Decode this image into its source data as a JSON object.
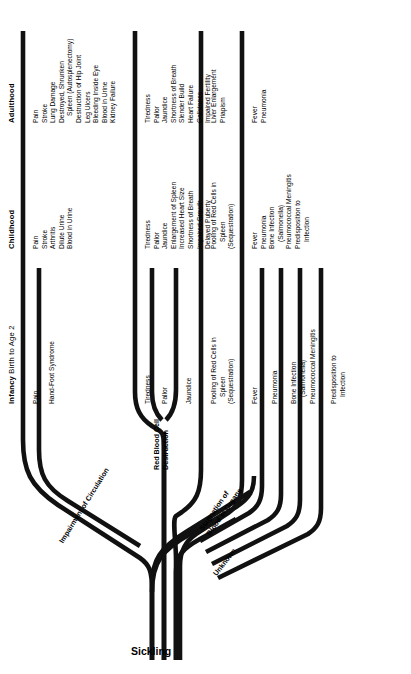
{
  "diagram": {
    "title": "Sickling",
    "root_label": "Sickling",
    "orientation": "rotated-90",
    "age_headers": [
      {
        "id": "infancy",
        "bold": "Infancy",
        "rest": " Birth to Age 2"
      },
      {
        "id": "childhood",
        "bold": "Childhood",
        "rest": ""
      },
      {
        "id": "adulthood",
        "bold": "Adulthood",
        "rest": ""
      }
    ],
    "pathways": [
      {
        "id": "impairment",
        "label": "Impairment of Circulation"
      },
      {
        "id": "rbc",
        "label": "Red Blood Cell\nDestruction",
        "line1": "Red Blood Cell",
        "line2": "Destruction"
      },
      {
        "id": "stagnation",
        "label": "Stagnation of\nBlood in Organs",
        "line1": "Stagnation of",
        "line2": "Blood in Organs"
      },
      {
        "id": "unknown",
        "label": "Unknown"
      }
    ],
    "branches": [
      {
        "id": "branch-pain",
        "pathway": "impairment",
        "start": "infancy",
        "infancy": [
          "Pain"
        ],
        "childhood": [
          "Pain",
          "Stroke",
          "Arthritis",
          "Dilute Urine",
          "Blood in Urine"
        ],
        "adulthood": [
          "Pain",
          "Stroke",
          "Lung Damage",
          "Destroyed, Shrunken",
          "Spleen (Autosplenectomy)",
          "Destruction of Hip Joint",
          "Leg Ulcers",
          "Bleeding Inside Eye",
          "Blood in Urine",
          "Kidney Failure"
        ]
      },
      {
        "id": "branch-hand-foot",
        "pathway": "impairment",
        "start": "infancy",
        "infancy": [
          "Hand-Foot Syndrome"
        ],
        "childhood": [],
        "adulthood": []
      },
      {
        "id": "branch-tiredness",
        "pathway": "rbc",
        "start": "infancy",
        "infancy": [
          "Tiredness"
        ],
        "childhood": [
          "Tiredness",
          "Pallor",
          "Jaundice",
          "Enlargement of Spleen",
          "Increased Heart Size",
          "Shortness of Breath",
          "Impaired Growth",
          "Delayed Puberty"
        ],
        "adulthood": [
          "Tiredness",
          "Pallor",
          "Jaundice",
          "Shortness of Breath",
          "Slender Build",
          "Heart Failure",
          "Gallstones",
          "Impaired Fertility"
        ]
      },
      {
        "id": "branch-pallor",
        "pathway": "rbc",
        "start": "infancy",
        "infancy": [
          "Pallor"
        ],
        "childhood": [],
        "adulthood": []
      },
      {
        "id": "branch-jaundice",
        "pathway": "rbc",
        "start": "infancy",
        "infancy": [
          "Jaundice"
        ],
        "childhood": [],
        "adulthood": []
      },
      {
        "id": "branch-pooling",
        "pathway": "stagnation",
        "start": "infancy",
        "infancy": [
          "Pooling of Red Cells in",
          "Spleen",
          "(Sequestration)"
        ],
        "childhood": [
          "Pooling of Red Cells in",
          "Spleen",
          "(Sequestration)"
        ],
        "adulthood": [
          "Liver Enlargement",
          "Priapism"
        ]
      },
      {
        "id": "branch-fever",
        "pathway": "unknown",
        "start": "infancy",
        "infancy": [
          "Fever"
        ],
        "childhood": [
          "Fever",
          "Pneumonia",
          "Bone Infection",
          "(Salmonella)",
          "Pneumococcal Meningitis",
          "Predisposition to",
          "Infection"
        ],
        "adulthood": [
          "Fever",
          "Pneumonia"
        ]
      },
      {
        "id": "branch-pneumonia",
        "pathway": "unknown",
        "start": "infancy",
        "infancy": [
          "Pneumonia"
        ],
        "childhood": [],
        "adulthood": []
      },
      {
        "id": "branch-bone-infection",
        "pathway": "unknown",
        "start": "infancy",
        "infancy": [
          "Bone Infection",
          "(Salmonella)"
        ],
        "childhood": [],
        "adulthood": []
      },
      {
        "id": "branch-pneumococcal",
        "pathway": "unknown",
        "start": "infancy",
        "infancy": [
          "Pneumococcal Meningitis"
        ],
        "childhood": [],
        "adulthood": []
      },
      {
        "id": "branch-predisposition",
        "pathway": "unknown",
        "start": "infancy",
        "infancy": [
          "Predisposition to",
          "Infection"
        ],
        "childhood": [],
        "adulthood": []
      }
    ],
    "colors": {
      "ink": "#111111",
      "background": "#ffffff"
    }
  },
  "labels": {
    "h_infancy_bold": "Infancy",
    "h_infancy_rest": " Birth to Age 2",
    "h_childhood": "Childhood",
    "h_adulthood": "Adulthood",
    "p_impairment": "Impairment of Circulation",
    "p_rbc_1": "Red Blood Cell",
    "p_rbc_2": "Destruction",
    "p_stag_1": "Stagnation of",
    "p_stag_2": "Blood in Organs",
    "p_unknown": "Unknown",
    "root": "Sickling",
    "b1_i1": "Pain",
    "b1_c1": "Pain",
    "b1_c2": "Stroke",
    "b1_c3": "Arthritis",
    "b1_c4": "Dilute Urine",
    "b1_c5": "Blood in Urine",
    "b1_a1": "Pain",
    "b1_a2": "Stroke",
    "b1_a3": "Lung Damage",
    "b1_a4": "Destroyed, Shrunken",
    "b1_a5": "Spleen (Autosplenectomy)",
    "b1_a6": "Destruction of Hip Joint",
    "b1_a7": "Leg Ulcers",
    "b1_a8": "Bleeding Inside Eye",
    "b1_a9": "Blood in Urine",
    "b1_a10": "Kidney Failure",
    "b2_i1": "Hand-Foot Syndrome",
    "b3_i1": "Tiredness",
    "b3_c1": "Tiredness",
    "b3_c2": "Pallor",
    "b3_c3": "Jaundice",
    "b3_c4": "Enlargement of Spleen",
    "b3_c5": "Increased Heart Size",
    "b3_c6": "Shortness of Breath",
    "b3_c7": "Impaired Growth",
    "b3_c8": "Delayed Puberty",
    "b3_a1": "Tiredness",
    "b3_a2": "Pallor",
    "b3_a3": "Jaundice",
    "b3_a4": "Shortness of Breath",
    "b3_a5": "Slender Build",
    "b3_a6": "Heart Failure",
    "b3_a7": "Gallstones",
    "b3_a8": "Impaired Fertility",
    "b4_i1": "Pallor",
    "b5_i1": "Jaundice",
    "b6_i1": "Pooling of Red Cells in",
    "b6_i2": "Spleen",
    "b6_i3": "(Sequestration)",
    "b6_c1": "Pooling of Red Cells in",
    "b6_c2": "Spleen",
    "b6_c3": "(Sequestration)",
    "b6_a1": "Liver Enlargement",
    "b6_a2": "Priapism",
    "b7_i1": "Fever",
    "b7_c1": "Fever",
    "b7_c2": "Pneumonia",
    "b7_c3": "Bone Infection",
    "b7_c4": "(Salmonella)",
    "b7_c5": "Pneumococcal Meningitis",
    "b7_c6": "Predisposition to",
    "b7_c7": "Infection",
    "b7_a1": "Fever",
    "b7_a2": "Pneumonia",
    "b8_i1": "Pneumonia",
    "b9_i1": "Bone Infection",
    "b9_i2": "(Salmonella)",
    "b10_i1": "Pneumococcal Meningitis",
    "b11_i1": "Predisposition to",
    "b11_i2": "Infection"
  }
}
